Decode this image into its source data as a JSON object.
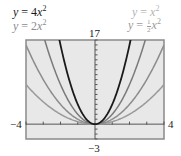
{
  "chart_data": {
    "type": "line",
    "title": "",
    "xlabel": "",
    "ylabel": "",
    "xlim": [
      -4,
      4
    ],
    "ylim": [
      -3,
      17
    ],
    "grid": false,
    "tick_labels": {
      "ymax": "17",
      "ymin": "−3",
      "xmin": "−4",
      "xmax": "4"
    },
    "x_tick_step": 1,
    "y_tick_step": 1,
    "series": [
      {
        "name": "y = 4x^2",
        "coefficient": 4,
        "color": "#1a1a1a"
      },
      {
        "name": "y = 2x^2",
        "coefficient": 2,
        "color": "#7a7a7a"
      },
      {
        "name": "y = x^2",
        "coefficient": 1,
        "color": "#8c8c8c"
      },
      {
        "name": "y = (1/2)x^2",
        "coefficient": 0.5,
        "color": "#9a9a9a"
      }
    ],
    "legend": [
      {
        "text_y": "y",
        "text_eq": "=",
        "coef": "4",
        "var": "x",
        "exp": "2",
        "position": "top-left",
        "color": "#1a1a1a"
      },
      {
        "text_y": "y",
        "text_eq": "=",
        "coef": "2",
        "var": "x",
        "exp": "2",
        "position": "top-left",
        "color": "#8c8c8c"
      },
      {
        "text_y": "y",
        "text_eq": "=",
        "coef": "",
        "var": "x",
        "exp": "2",
        "position": "top-right",
        "color": "#b4b4b4"
      },
      {
        "text_y": "y",
        "text_eq": "=",
        "frac_num": "1",
        "frac_den": "2",
        "var": "x",
        "exp": "2",
        "position": "top-right",
        "color": "#9a9a9a"
      }
    ]
  },
  "colors": {
    "plot_background": "#e8e8e8",
    "frame": "#8a8a8a",
    "axis": "#555555"
  }
}
